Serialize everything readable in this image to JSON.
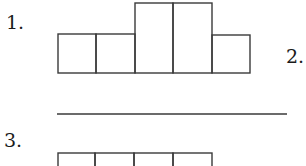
{
  "figure": {
    "kind": "net-of-boxes worksheet",
    "items": [
      {
        "label": "1.",
        "label_pos": {
          "x": 6,
          "y": 29
        },
        "shape": "row of 5 squares with middle two extended upward",
        "boxes": [
          {
            "x": 58,
            "y": 34,
            "w": 38,
            "h": 39
          },
          {
            "x": 96,
            "y": 34,
            "w": 39,
            "h": 39
          },
          {
            "x": 135,
            "y": 3,
            "w": 38,
            "h": 70
          },
          {
            "x": 173,
            "y": 3,
            "w": 39,
            "h": 70
          },
          {
            "x": 212,
            "y": 35,
            "w": 38,
            "h": 38
          }
        ]
      },
      {
        "label": "2.",
        "label_pos": {
          "x": 286,
          "y": 63
        },
        "shape": "blank answer line",
        "line": {
          "x1": 57,
          "y1": 114,
          "x2": 287,
          "y2": 114
        }
      },
      {
        "label": "3.",
        "label_pos": {
          "x": 4,
          "y": 147
        },
        "shape": "row of 4 squares (cropped at bottom)",
        "boxes": [
          {
            "x": 58,
            "y": 153,
            "w": 37,
            "h": 40
          },
          {
            "x": 95,
            "y": 153,
            "w": 39,
            "h": 40
          },
          {
            "x": 134,
            "y": 153,
            "w": 39,
            "h": 40
          },
          {
            "x": 173,
            "y": 153,
            "w": 39,
            "h": 40
          }
        ]
      }
    ]
  },
  "colors": {
    "stroke": "#3a3a3a",
    "text": "#1a1a1a",
    "background": "#ffffff"
  }
}
